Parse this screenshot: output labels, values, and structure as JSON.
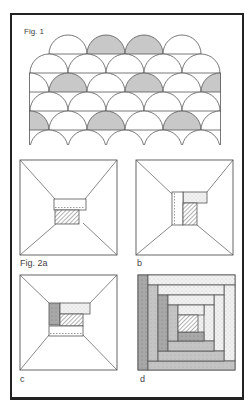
{
  "figure1": {
    "label": "Fig. 1",
    "description": "clamshell / fish-scale patchwork pattern",
    "fill_color": "#c8c8c8",
    "stroke_color": "#555555"
  },
  "figure2": {
    "panels": [
      {
        "id": "a",
        "label": "Fig. 2a"
      },
      {
        "id": "b",
        "label": "b"
      },
      {
        "id": "c",
        "label": "c"
      },
      {
        "id": "d",
        "label": "d"
      }
    ],
    "colors": {
      "stroke": "#555555",
      "hatch": "#666666",
      "dotted_fill": "#eeeeee",
      "dark_fill": "#a8a8a8",
      "mid_fill": "#c4c4c4"
    }
  }
}
